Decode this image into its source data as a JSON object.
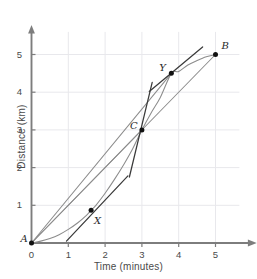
{
  "chart_data": {
    "type": "line",
    "title": "",
    "xlabel": "Time (minutes)",
    "ylabel": "Distance (km)",
    "xlim": [
      0,
      6.1
    ],
    "ylim": [
      0,
      5.7
    ],
    "xticks": [
      0,
      1,
      2,
      3,
      4,
      5
    ],
    "yticks": [
      0,
      1,
      2,
      3,
      4,
      5
    ],
    "xtick_labels": [
      "0",
      "1",
      "2",
      "3",
      "4",
      "5"
    ],
    "ytick_labels": [
      "0",
      "1",
      "2",
      "3",
      "4",
      "5"
    ],
    "grid": true,
    "grid_color": "#e8e8ec",
    "axis_color": "#7d7d7d",
    "curve_color": "#8c8c8c",
    "chord_color": "#8c8c8c",
    "tangent_color": "#3a3a3a",
    "point_color": "#111111",
    "legend": "none",
    "series": [
      {
        "name": "distance-curve",
        "kind": "curve",
        "color": "#8c8c8c",
        "x": [
          0.0,
          0.25,
          0.5,
          0.75,
          1.0,
          1.25,
          1.5,
          1.62,
          1.75,
          2.0,
          2.25,
          2.5,
          2.75,
          3.0,
          3.25,
          3.5,
          3.8,
          4.0,
          4.25,
          4.5,
          4.75,
          5.0
        ],
        "y": [
          0.0,
          0.05,
          0.12,
          0.22,
          0.36,
          0.53,
          0.74,
          0.87,
          1.0,
          1.32,
          1.68,
          2.07,
          2.5,
          3.0,
          3.45,
          3.86,
          4.5,
          4.55,
          4.72,
          4.84,
          4.94,
          5.0
        ]
      },
      {
        "name": "chord-A-to-B",
        "kind": "segment",
        "color": "#8c8c8c",
        "x": [
          0.0,
          5.0
        ],
        "y": [
          0.0,
          5.0
        ]
      },
      {
        "name": "chord-A-to-C",
        "kind": "segment",
        "color": "#8c8c8c",
        "x": [
          0.0,
          3.0
        ],
        "y": [
          0.0,
          3.0
        ]
      },
      {
        "name": "chord-C-to-Y",
        "kind": "segment",
        "color": "#8c8c8c",
        "x": [
          0.0,
          3.8
        ],
        "y": [
          0.0,
          4.5
        ]
      },
      {
        "name": "tangent-at-X",
        "kind": "segment",
        "color": "#3a3a3a",
        "x": [
          0.95,
          2.62
        ],
        "y": [
          0.05,
          1.78
        ]
      },
      {
        "name": "tangent-at-C",
        "kind": "segment",
        "color": "#3a3a3a",
        "x": [
          2.66,
          3.28
        ],
        "y": [
          1.75,
          4.26
        ]
      },
      {
        "name": "tangent-at-Y",
        "kind": "segment",
        "color": "#3a3a3a",
        "x": [
          3.2,
          4.65
        ],
        "y": [
          4.02,
          5.2
        ]
      }
    ],
    "points": [
      {
        "label": "A",
        "x": 0.0,
        "y": 0.0,
        "label_dx": -11,
        "label_dy": -3
      },
      {
        "label": "X",
        "x": 1.62,
        "y": 0.87,
        "label_dx": 3,
        "label_dy": 12
      },
      {
        "label": "C",
        "x": 3.0,
        "y": 3.0,
        "label_dx": -12,
        "label_dy": -3
      },
      {
        "label": "Y",
        "x": 3.8,
        "y": 4.5,
        "label_dx": -12,
        "label_dy": -4
      },
      {
        "label": "B",
        "x": 5.0,
        "y": 5.0,
        "label_dx": 6,
        "label_dy": -8
      }
    ]
  }
}
